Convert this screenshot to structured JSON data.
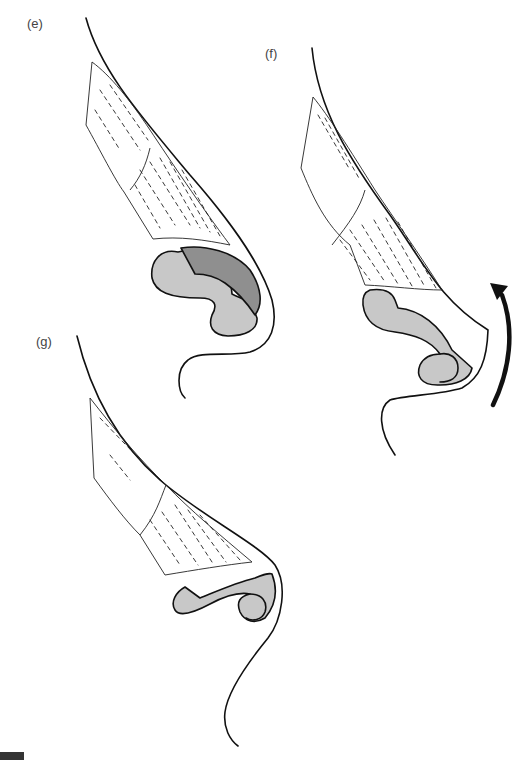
{
  "figure": {
    "panels": [
      {
        "id": "e",
        "label": "(e)",
        "description": "Nasal profile with upper lateral cartilage and lower lateral cartilage; lateral crus shaded dark"
      },
      {
        "id": "f",
        "label": "(f)",
        "description": "Nasal profile after tip rotation; curved arrow indicates upward rotation"
      },
      {
        "id": "g",
        "label": "(g)",
        "description": "Nasal profile with reshaped lower lateral cartilage"
      }
    ],
    "colors": {
      "outline": "#111111",
      "cartilage_light": "#c8c8c8",
      "cartilage_dark": "#8f8f8f",
      "background": "#ffffff"
    },
    "annotations": {
      "rotation_arrow": "curved-arrow-up"
    }
  }
}
